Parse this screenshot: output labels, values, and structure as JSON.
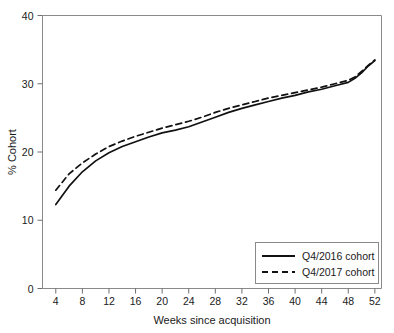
{
  "chart_data": {
    "type": "line",
    "title": "",
    "xlabel": "Weeks since  acquisition",
    "ylabel": "% Cohort",
    "xlim": [
      2,
      53
    ],
    "ylim": [
      0,
      40
    ],
    "grid": false,
    "legend_position": "bottom-right",
    "xticks": [
      4,
      8,
      12,
      16,
      20,
      24,
      28,
      32,
      36,
      40,
      44,
      48,
      52
    ],
    "yticks": [
      0,
      10,
      20,
      30,
      40
    ],
    "x": [
      4,
      6,
      8,
      10,
      12,
      14,
      16,
      18,
      20,
      22,
      24,
      26,
      28,
      30,
      32,
      34,
      36,
      38,
      40,
      42,
      44,
      46,
      48,
      49,
      50,
      51,
      52
    ],
    "series": [
      {
        "name": "Q4/2016 cohort",
        "style": "solid",
        "color": "#111111",
        "values": [
          12.3,
          15.0,
          17.1,
          18.7,
          19.9,
          20.8,
          21.5,
          22.2,
          22.8,
          23.2,
          23.7,
          24.4,
          25.1,
          25.8,
          26.4,
          26.9,
          27.4,
          27.9,
          28.3,
          28.8,
          29.2,
          29.7,
          30.2,
          30.8,
          31.6,
          32.6,
          33.4
        ]
      },
      {
        "name": "Q4/2017 cohort",
        "style": "dashed",
        "color": "#111111",
        "values": [
          14.4,
          16.8,
          18.4,
          19.7,
          20.8,
          21.6,
          22.3,
          22.9,
          23.5,
          24.0,
          24.5,
          25.1,
          25.8,
          26.4,
          26.9,
          27.4,
          27.9,
          28.3,
          28.7,
          29.1,
          29.5,
          30.0,
          30.5,
          31.0,
          31.8,
          32.7,
          33.5
        ]
      }
    ]
  },
  "legend": {
    "entries": [
      {
        "label": "Q4/2016 cohort",
        "style": "solid"
      },
      {
        "label": "Q4/2017 cohort",
        "style": "dashed"
      }
    ]
  },
  "axes": {
    "x_title": "Weeks since  acquisition",
    "y_title": "% Cohort",
    "x_tick_labels": [
      "4",
      "8",
      "12",
      "16",
      "20",
      "24",
      "28",
      "32",
      "36",
      "40",
      "44",
      "48",
      "52"
    ],
    "y_tick_labels": [
      "0",
      "10",
      "20",
      "30",
      "40"
    ]
  },
  "colors": {
    "background": "#ffffff",
    "ink": "#111111",
    "frame": "#8a8a8a"
  }
}
